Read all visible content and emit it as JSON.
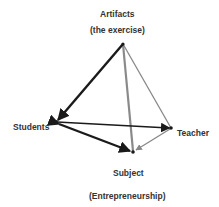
{
  "labels": {
    "artifacts": "Artifacts",
    "artifacts_sub": "(the exercise)",
    "students": "Students",
    "teacher": "Teacher",
    "subject": "Subject",
    "subject_sub": "(Entrepreneurship)"
  },
  "nodes": {
    "artifacts": {
      "x": 123,
      "y": 44
    },
    "students": {
      "x": 56,
      "y": 122
    },
    "teacher": {
      "x": 171,
      "y": 128
    },
    "subject": {
      "x": 133,
      "y": 152
    }
  },
  "colors": {
    "dark": "#1a1a1a",
    "gray": "#888888",
    "text": "#333333"
  }
}
